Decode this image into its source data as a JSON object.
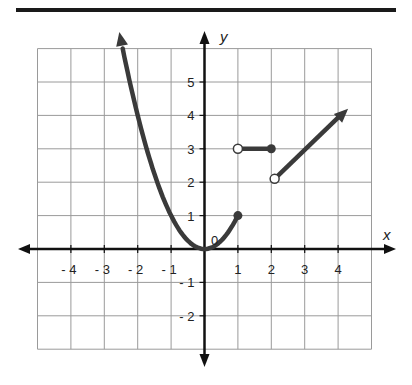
{
  "figure": {
    "x_axis_label": "x",
    "y_axis_label": "y",
    "origin_label": "0",
    "x_ticks": [
      {
        "value": -4,
        "label": "- 4"
      },
      {
        "value": -3,
        "label": "- 3"
      },
      {
        "value": -2,
        "label": "- 2"
      },
      {
        "value": -1,
        "label": "- 1"
      },
      {
        "value": 1,
        "label": "1"
      },
      {
        "value": 2,
        "label": "2"
      },
      {
        "value": 3,
        "label": "3"
      },
      {
        "value": 4,
        "label": "4"
      }
    ],
    "y_ticks": [
      {
        "value": 5,
        "label": "5"
      },
      {
        "value": 4,
        "label": "4"
      },
      {
        "value": 3,
        "label": "3"
      },
      {
        "value": 2,
        "label": "2"
      },
      {
        "value": 1,
        "label": "1"
      },
      {
        "value": -1,
        "label": "- 1"
      },
      {
        "value": -2,
        "label": "- 2"
      }
    ],
    "grid": {
      "x_min": -5,
      "x_max": 5,
      "y_min": -3,
      "y_max": 6
    },
    "colors": {
      "curve": "#3a3a3a",
      "grid": "#9a9a9a",
      "axis": "#111111",
      "rule": "#1a1a1a"
    }
  },
  "chart_data": {
    "type": "line",
    "title": "",
    "xlabel": "x",
    "ylabel": "y",
    "xlim": [
      -5,
      5
    ],
    "ylim": [
      -3,
      6
    ],
    "grid": true,
    "series": [
      {
        "name": "piece 1: y = x^2 (x <= 1)",
        "domain": [
          -2.5,
          1
        ],
        "points": [
          [
            -2.5,
            6.25
          ],
          [
            -2,
            4
          ],
          [
            -1,
            1
          ],
          [
            0,
            0
          ],
          [
            1,
            1
          ]
        ],
        "left_end": "arrow",
        "right_end": "closed"
      },
      {
        "name": "piece 2: y = 3 (1 < x <= 2)",
        "points": [
          [
            1,
            3
          ],
          [
            2,
            3
          ]
        ],
        "left_end": "open",
        "right_end": "closed"
      },
      {
        "name": "piece 3: y = x (x > 2)",
        "points": [
          [
            2.1,
            2.1
          ],
          [
            4.3,
            4.2
          ]
        ],
        "left_end": "open",
        "right_end": "arrow"
      }
    ]
  }
}
